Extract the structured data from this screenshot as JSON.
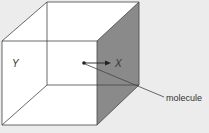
{
  "diagram": {
    "labels": {
      "left_face": "Y",
      "arrow_target": "X",
      "callout": "molecule"
    },
    "colors": {
      "background": "#ececec",
      "face": "#ffffff",
      "shaded_face": "#8a8a8a",
      "edge": "#444444"
    }
  }
}
